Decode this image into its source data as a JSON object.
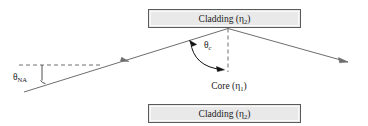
{
  "figure": {
    "background_color": "#ffffff",
    "width": 368,
    "height": 126
  },
  "cladding_top": {
    "label_main": "Cladding (",
    "label_symbol": "η",
    "label_subscript": "2",
    "label_close": ")",
    "full_label": "Cladding (η₂)",
    "fill_color": "#e8e8e8",
    "stroke_color": "#555555"
  },
  "cladding_bottom": {
    "label_main": "Cladding (",
    "label_symbol": "η",
    "label_subscript": "2",
    "label_close": ")",
    "full_label": "Cladding (η₂)",
    "fill_color": "#e8e8e8",
    "stroke_color": "#555555"
  },
  "core": {
    "label_main": "Core (",
    "label_symbol": "η",
    "label_subscript": "1",
    "label_close": ")",
    "full_label": "Core (η₁)"
  },
  "angle_na": {
    "symbol": "θ",
    "subscript": "NA",
    "full_label": "θNA"
  },
  "angle_critical": {
    "symbol": "θ",
    "subscript": "c",
    "full_label": "θc"
  },
  "rays": {
    "incoming_color": "#6b6b6b",
    "outgoing_color": "#6b6b6b",
    "dashed_color": "#6b6b6b",
    "arc_color": "#111111"
  }
}
